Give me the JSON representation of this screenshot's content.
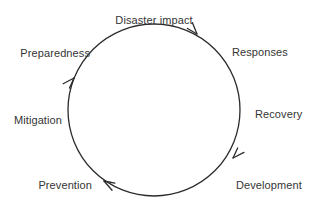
{
  "diagram": {
    "title_label": "Disaster impact",
    "type": "cyclical-process-diagram",
    "background_color": "#ffffff",
    "stroke_color": "#2b2b2b",
    "text_color": "#353535",
    "circle": {
      "center_x": 154,
      "center_y": 110,
      "radius": 86,
      "stroke_width": 1.3,
      "direction": "clockwise"
    },
    "stages": [
      {
        "id": "disaster-impact",
        "label": "Disaster impact",
        "x": 154,
        "y": 14,
        "anchor": "mid"
      },
      {
        "id": "responses",
        "label": "Responses",
        "x": 232,
        "y": 46,
        "anchor": "start"
      },
      {
        "id": "recovery",
        "label": "Recovery",
        "x": 255,
        "y": 108,
        "anchor": "start"
      },
      {
        "id": "development",
        "label": "Development",
        "x": 236,
        "y": 179,
        "anchor": "start"
      },
      {
        "id": "prevention",
        "label": "Prevention",
        "x": 92,
        "y": 179,
        "anchor": "end"
      },
      {
        "id": "mitigation",
        "label": "Mitigation",
        "x": 62,
        "y": 114,
        "anchor": "end"
      },
      {
        "id": "preparedness",
        "label": "Preparedness",
        "x": 90,
        "y": 47,
        "anchor": "end"
      }
    ],
    "arrowheads": [
      {
        "id": "arrow-top-right",
        "angle_deg": 312,
        "tip_x": 197,
        "tip_y": 34,
        "points": "clockwise"
      },
      {
        "id": "arrow-bottom-right",
        "angle_deg": 215,
        "tip_x": 233,
        "tip_y": 158,
        "points": "clockwise"
      },
      {
        "id": "arrow-bottom-left",
        "angle_deg": 137,
        "tip_x": 104,
        "tip_y": 181,
        "points": "clockwise"
      },
      {
        "id": "arrow-top-left",
        "angle_deg": 48,
        "tip_x": 74,
        "tip_y": 78,
        "points": "clockwise"
      }
    ]
  }
}
